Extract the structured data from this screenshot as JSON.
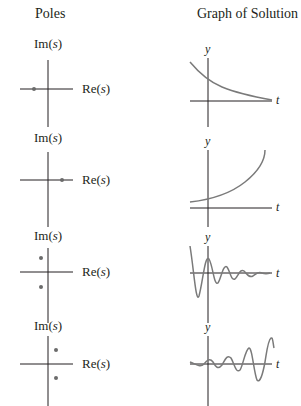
{
  "headers": {
    "poles": "Poles",
    "graph": "Graph of Solution"
  },
  "axis_labels": {
    "im": "Im(s)",
    "re": "Re(s)",
    "y": "y",
    "t": "t"
  },
  "colors": {
    "axis": "#231f20",
    "curve": "#7a7a7a",
    "pole": "#6b6b6b"
  },
  "rows": [
    {
      "poles": [
        {
          "re": -1,
          "im": 0
        }
      ],
      "solution": "exponential decay"
    },
    {
      "poles": [
        {
          "re": 1,
          "im": 0
        }
      ],
      "solution": "exponential growth"
    },
    {
      "poles": [
        {
          "re": -0.5,
          "im": 1
        },
        {
          "re": -0.5,
          "im": -1
        }
      ],
      "solution": "damped oscillation"
    },
    {
      "poles": [
        {
          "re": 0.5,
          "im": 1
        },
        {
          "re": 0.5,
          "im": -1
        }
      ],
      "solution": "growing oscillation"
    }
  ]
}
